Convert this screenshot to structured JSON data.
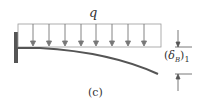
{
  "diagram": {
    "load_label": "q",
    "deflection_label": {
      "paren_open": "(",
      "symbol": "δ",
      "subscript": "B",
      "paren_close": ")",
      "index": "1"
    },
    "caption": "(c)",
    "load_arrow_count": 8,
    "colors": {
      "beam": "#555555",
      "wall": "#555555",
      "load": "#777777",
      "text": "#333333"
    }
  }
}
